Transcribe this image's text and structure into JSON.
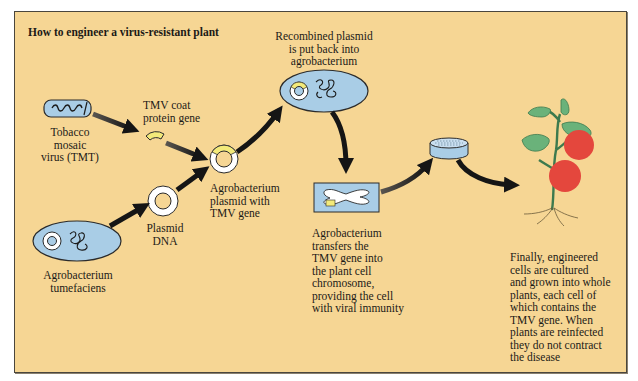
{
  "title": "How to engineer a virus-resistant plant",
  "colors": {
    "background": "#f6d694",
    "border": "#4a463d",
    "cell_blue": "#a9cde6",
    "gene_yellow": "#f3ea7a",
    "arrow": "#1a1a1a",
    "tomato_red": "#e4473d",
    "leaf_green": "#5ea56a"
  },
  "steps": [
    {
      "id": "virus",
      "icon": "virus-rod-icon",
      "label": "Tobacco\nmosaic\nvirus (TMT)"
    },
    {
      "id": "coat-gene",
      "icon": "gene-fragment-icon",
      "label": "TMV coat\nprotein gene"
    },
    {
      "id": "agrobacterium",
      "icon": "bacterium-cell-icon",
      "label": "Agrobacterium\ntumefaciens"
    },
    {
      "id": "plasmid",
      "icon": "plasmid-ring-icon",
      "label": "Plasmid\nDNA"
    },
    {
      "id": "recombinant-plasmid",
      "icon": "recombinant-plasmid-icon",
      "label": "Agrobacterium\nplasmid with\nTMV gene"
    },
    {
      "id": "reinsert",
      "icon": "bacterium-cell-icon",
      "label": "Recombined plasmid\nis put back into\nagrobacterium"
    },
    {
      "id": "transfer",
      "icon": "chromosome-icon",
      "label": "Agrobacterium\ntransfers the\nTMV gene into\nthe plant cell\nchromosome,\nproviding the cell\nwith viral immunity"
    },
    {
      "id": "culture",
      "icon": "petri-dish-icon",
      "label": ""
    },
    {
      "id": "plant",
      "icon": "tomato-plant-icon",
      "label": "Finally, engineered\ncells are cultured\nand grown into whole\nplants, each cell of\nwhich contains the\nTMV gene.  When\nplants are reinfected\nthey do not contract\nthe disease"
    }
  ]
}
